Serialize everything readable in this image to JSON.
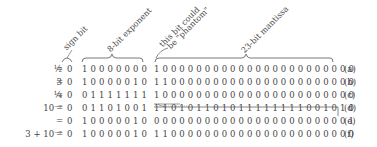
{
  "labels": {
    "sign": "sign bit",
    "exponent": "8-bit exponent",
    "phantom_line1": "this bit could",
    "phantom_line2": "be \"phantom\"",
    "mantissa": "23-bit mantissa"
  },
  "rows": [
    {
      "lhs": "½",
      "eq": "=",
      "sign": "0",
      "exponent": "10000000",
      "mantissa": "100000000000000000000000",
      "tag": "(a)"
    },
    {
      "lhs": "3",
      "eq": "=",
      "sign": "0",
      "exponent": "10000010",
      "mantissa": "110000000000000000000000",
      "tag": "(b)"
    },
    {
      "lhs": "¼",
      "eq": "=",
      "sign": "0",
      "exponent": "01111111",
      "mantissa": "100000000000000000000000",
      "tag": "(c)"
    },
    {
      "lhs": "10⁻⁷",
      "eq": "=",
      "sign": "0",
      "exponent": "01101001",
      "mantissa": "110101101011111111001010",
      "tag": "(d)"
    },
    {
      "lhs": "",
      "eq": "=",
      "sign": "0",
      "exponent": "10000010",
      "mantissa": "000000000000000000000001",
      "tag": "(e)"
    },
    {
      "lhs": "3 + 10⁻⁷",
      "eq": "=",
      "sign": "0",
      "exponent": "10000010",
      "mantissa": "110000000000000000000000",
      "tag": "(f)"
    }
  ]
}
